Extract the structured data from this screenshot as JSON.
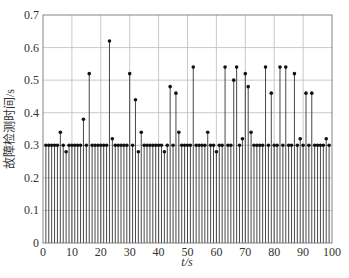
{
  "chart_data": {
    "type": "stem",
    "title": "",
    "xlabel": "t/s",
    "ylabel": "故障检测时间/s",
    "xlim": [
      0,
      100
    ],
    "ylim": [
      0,
      0.7
    ],
    "xticks": [
      0,
      10,
      20,
      30,
      40,
      50,
      60,
      70,
      80,
      90,
      100
    ],
    "yticks": [
      0,
      0.1,
      0.2,
      0.3,
      0.4,
      0.5,
      0.6,
      0.7
    ],
    "ytick_labels": [
      "0",
      "0.1",
      "0.2",
      "0.3",
      "0.4",
      "0.5",
      "0.6",
      "0.7"
    ],
    "grid": true,
    "legend": null,
    "baseline_value": 0.3,
    "x": [
      1,
      2,
      3,
      4,
      5,
      6,
      7,
      8,
      9,
      10,
      11,
      12,
      13,
      14,
      15,
      16,
      17,
      18,
      19,
      20,
      21,
      22,
      23,
      24,
      25,
      26,
      27,
      28,
      29,
      30,
      31,
      32,
      33,
      34,
      35,
      36,
      37,
      38,
      39,
      40,
      41,
      42,
      43,
      44,
      45,
      46,
      47,
      48,
      49,
      50,
      51,
      52,
      53,
      54,
      55,
      56,
      57,
      58,
      59,
      60,
      61,
      62,
      63,
      64,
      65,
      66,
      67,
      68,
      69,
      70,
      71,
      72,
      73,
      74,
      75,
      76,
      77,
      78,
      79,
      80,
      81,
      82,
      83,
      84,
      85,
      86,
      87,
      88,
      89,
      90,
      91,
      92,
      93,
      94,
      95,
      96,
      97,
      98,
      99
    ],
    "values": [
      0.3,
      0.3,
      0.3,
      0.3,
      0.3,
      0.34,
      0.3,
      0.28,
      0.3,
      0.3,
      0.3,
      0.3,
      0.3,
      0.38,
      0.3,
      0.52,
      0.3,
      0.3,
      0.3,
      0.3,
      0.3,
      0.3,
      0.62,
      0.32,
      0.3,
      0.3,
      0.3,
      0.3,
      0.3,
      0.52,
      0.3,
      0.44,
      0.28,
      0.34,
      0.3,
      0.3,
      0.3,
      0.3,
      0.3,
      0.3,
      0.3,
      0.28,
      0.3,
      0.48,
      0.3,
      0.46,
      0.34,
      0.3,
      0.3,
      0.3,
      0.3,
      0.54,
      0.3,
      0.3,
      0.3,
      0.3,
      0.34,
      0.3,
      0.3,
      0.28,
      0.3,
      0.3,
      0.54,
      0.3,
      0.3,
      0.5,
      0.54,
      0.3,
      0.32,
      0.52,
      0.48,
      0.34,
      0.3,
      0.3,
      0.3,
      0.3,
      0.54,
      0.3,
      0.46,
      0.3,
      0.3,
      0.54,
      0.3,
      0.54,
      0.3,
      0.3,
      0.52,
      0.3,
      0.32,
      0.3,
      0.46,
      0.3,
      0.46,
      0.3,
      0.3,
      0.3,
      0.3,
      0.32,
      0.3
    ]
  },
  "colors": {
    "stem": "#333333",
    "marker": "#111111",
    "grid": "#bdbdbd",
    "background": "#ffffff"
  }
}
